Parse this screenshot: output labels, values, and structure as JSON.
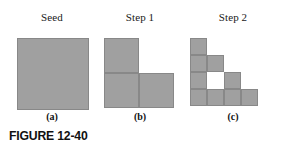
{
  "figure": {
    "number_label": "FIGURE 12-40",
    "background_color": "#ffffff",
    "fill_color": "#a0a0a0",
    "stroke_color": "#888888"
  },
  "panels": [
    {
      "id": "seed",
      "title": "Seed",
      "caption": "(a)",
      "grid": {
        "cols": 1,
        "rows": 1,
        "cell_size": 72
      },
      "filled_cells": [
        [
          0,
          0
        ]
      ]
    },
    {
      "id": "step1",
      "title": "Step 1",
      "caption": "(b)",
      "grid": {
        "cols": 2,
        "rows": 2,
        "cell_size": 35
      },
      "filled_cells": [
        [
          0,
          0
        ],
        [
          0,
          1
        ],
        [
          1,
          1
        ]
      ]
    },
    {
      "id": "step2",
      "title": "Step 2",
      "caption": "(c)",
      "grid": {
        "cols": 4,
        "rows": 4,
        "cell_size": 17
      },
      "filled_cells": [
        [
          0,
          0
        ],
        [
          0,
          1
        ],
        [
          1,
          1
        ],
        [
          0,
          2
        ],
        [
          2,
          2
        ],
        [
          0,
          3
        ],
        [
          1,
          3
        ],
        [
          2,
          3
        ],
        [
          3,
          3
        ]
      ]
    }
  ]
}
